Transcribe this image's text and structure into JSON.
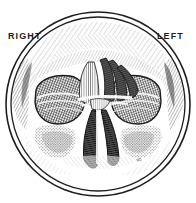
{
  "figure": {
    "name": "coronal-section-nasal-cavity",
    "style": "vintage-engraving",
    "frame": {
      "shape": "double-circle",
      "center_x": 98,
      "center_y": 104,
      "outer_radius": 92,
      "inner_radius": 87
    },
    "colors": {
      "ink": "#1d1d1d",
      "paper": "#ffffff",
      "mid_tone": "#6b6b6b",
      "light_tone": "#b4b4b4",
      "shadow": "#2a2a2a"
    },
    "labels": {
      "right": "RIGHT",
      "left": "LEFT"
    },
    "structures": [
      {
        "name": "frontal-bone",
        "tone": "light-hatch"
      },
      {
        "name": "orbit-right",
        "tone": "dark-crosshatch"
      },
      {
        "name": "orbit-left",
        "tone": "dark-crosshatch"
      },
      {
        "name": "nasal-septum",
        "tone": "vertical-hatch"
      },
      {
        "name": "turbinate-superior-left",
        "tone": "dark"
      },
      {
        "name": "turbinate-middle-left",
        "tone": "dark"
      },
      {
        "name": "turbinate-inferior-left",
        "tone": "dark"
      },
      {
        "name": "nasal-passage-right",
        "tone": "dark"
      },
      {
        "name": "nasal-passage-left",
        "tone": "dark"
      },
      {
        "name": "maxillary-sinus-right",
        "tone": "stipple"
      },
      {
        "name": "maxillary-sinus-left",
        "tone": "stipple"
      },
      {
        "name": "zygomatic-arch-right",
        "tone": "mid-hatch"
      },
      {
        "name": "zygomatic-arch-left",
        "tone": "mid-hatch"
      },
      {
        "name": "artist-mark",
        "tone": "faint"
      }
    ]
  }
}
